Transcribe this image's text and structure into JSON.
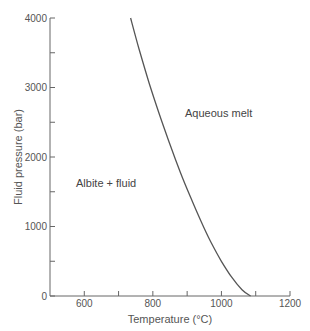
{
  "chart_data": {
    "type": "line",
    "title": "",
    "xlabel": "Temperature (°C)",
    "ylabel": "Fluid pressure (bar)",
    "xlim": [
      500,
      1200
    ],
    "ylim": [
      0,
      4000
    ],
    "x_ticks": [
      600,
      700,
      800,
      900,
      1000,
      1100,
      1200
    ],
    "x_tick_labels": [
      "600",
      "800",
      "1000",
      "1200"
    ],
    "y_ticks": [
      0,
      500,
      1000,
      1500,
      2000,
      2500,
      3000,
      3500,
      4000
    ],
    "y_tick_labels": [
      "0",
      "1000",
      "2000",
      "3000",
      "4000"
    ],
    "grid": false,
    "series": [
      {
        "name": "Albite solidus (wet melting curve)",
        "x": [
          735,
          760,
          790,
          820,
          850,
          880,
          910,
          940,
          970,
          1000,
          1030,
          1060,
          1085
        ],
        "y": [
          4000,
          3550,
          3050,
          2600,
          2180,
          1780,
          1420,
          1080,
          770,
          500,
          270,
          90,
          0
        ]
      }
    ],
    "annotations": [
      {
        "text": "Aqueous melt",
        "x": 930,
        "y": 2600
      },
      {
        "text": "Albite + fluid",
        "x": 620,
        "y": 1600
      }
    ]
  }
}
